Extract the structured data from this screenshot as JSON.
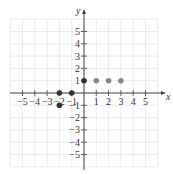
{
  "chart_data": {
    "type": "scatter",
    "title": "",
    "xlabel": "x",
    "ylabel": "y",
    "xlim": [
      -6,
      6
    ],
    "ylim": [
      -6,
      6
    ],
    "grid": true,
    "x_ticks": [
      -5,
      -4,
      -3,
      -2,
      -1,
      1,
      2,
      3,
      4,
      5
    ],
    "y_ticks": [
      -5,
      -4,
      -3,
      -2,
      -1,
      1,
      2,
      3,
      4,
      5
    ],
    "series": [
      {
        "name": "dark points",
        "color": "#333333",
        "points": [
          [
            0,
            1
          ],
          [
            -2,
            0
          ],
          [
            -1,
            0
          ],
          [
            -2,
            -1
          ]
        ]
      },
      {
        "name": "gray points",
        "color": "#888888",
        "points": [
          [
            1,
            1
          ],
          [
            2,
            1
          ],
          [
            3,
            1
          ]
        ]
      }
    ]
  },
  "labels": {
    "x": "x",
    "y": "y"
  }
}
